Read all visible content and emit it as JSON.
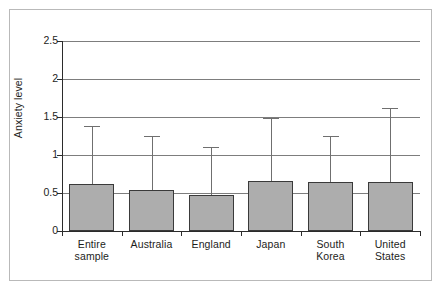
{
  "chart_data": {
    "type": "bar",
    "title": "",
    "subtitle": "",
    "xlabel": "",
    "ylabel": "Anxiety level",
    "ylim": [
      0,
      2.5
    ],
    "yticks": [
      "0",
      "0.5",
      "1",
      "1.5",
      "2",
      "2.5"
    ],
    "ytick_values": [
      0,
      0.5,
      1,
      1.5,
      2,
      2.5
    ],
    "grid": true,
    "legend": "none",
    "error_bars": "upper-only",
    "categories": [
      "Entire sample",
      "Australia",
      "England",
      "Japan",
      "South Korea",
      "United States"
    ],
    "category_lines": [
      [
        "Entire",
        "sample"
      ],
      [
        "Australia"
      ],
      [
        "England"
      ],
      [
        "Japan"
      ],
      [
        "South",
        "Korea"
      ],
      [
        "United",
        "States"
      ]
    ],
    "values": [
      0.62,
      0.54,
      0.47,
      0.66,
      0.65,
      0.64
    ],
    "error_upper": [
      1.38,
      1.25,
      1.1,
      1.49,
      1.25,
      1.62
    ],
    "series": [
      {
        "name": "Anxiety level",
        "values": [
          0.62,
          0.54,
          0.47,
          0.66,
          0.65,
          0.64
        ],
        "error_upper": [
          1.38,
          1.25,
          1.1,
          1.49,
          1.25,
          1.62
        ]
      }
    ],
    "colors": {
      "bar_fill": "#adadad",
      "bar_border": "#3a3a3a",
      "gridline": "#7d7d7d",
      "axis": "#2b2b2b",
      "error_bar": "#6f6f6f",
      "frame": "#b9b9b9",
      "text": "#1d1d1b",
      "background": "#ffffff"
    }
  }
}
